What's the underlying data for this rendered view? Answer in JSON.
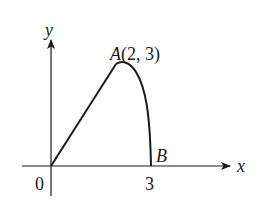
{
  "diagram": {
    "type": "coordinate-graph",
    "axes": {
      "x_label": "x",
      "y_label": "y",
      "origin_label": "0",
      "x_tick_label": "3"
    },
    "points": {
      "A": {
        "label": "A(2, 3)",
        "name": "A",
        "x": 2,
        "y": 3
      },
      "B": {
        "label": "B",
        "name": "B",
        "x": 3,
        "y": 0
      }
    },
    "curve": {
      "segment_OA": "straight line from (0,0) to A(2,3)",
      "arc_AB": "curved arc from A(2,3) down to B(3,0)"
    },
    "colors": {
      "stroke": "#1a1a1a",
      "background": "#ffffff"
    }
  }
}
